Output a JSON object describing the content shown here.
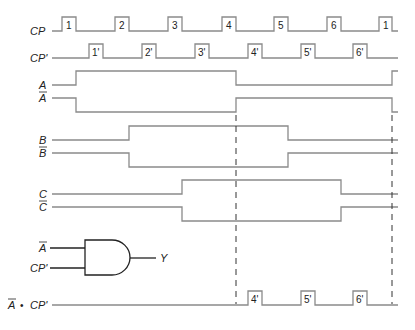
{
  "diagram": {
    "type": "timing-diagram",
    "signals": {
      "cp": {
        "label": "CP",
        "pulses": [
          "1",
          "2",
          "3",
          "4",
          "5",
          "6",
          "1"
        ]
      },
      "cp_prime": {
        "label": "CP'",
        "pulses": [
          "1'",
          "2'",
          "3'",
          "4'",
          "5'",
          "6'"
        ]
      },
      "a": {
        "label": "A"
      },
      "a_bar": {
        "label": "A",
        "overbar": true
      },
      "b": {
        "label": "B"
      },
      "b_bar": {
        "label": "B",
        "overbar": true
      },
      "c": {
        "label": "C"
      },
      "c_bar": {
        "label": "C",
        "overbar": true
      },
      "output": {
        "label_a": "A",
        "dot": "•",
        "label_cp": "CP'",
        "pulses": [
          "4'",
          "5'",
          "6'"
        ]
      }
    },
    "gate": {
      "type": "AND",
      "input_1": "A",
      "input_2": "CP'",
      "output": "Y"
    }
  }
}
